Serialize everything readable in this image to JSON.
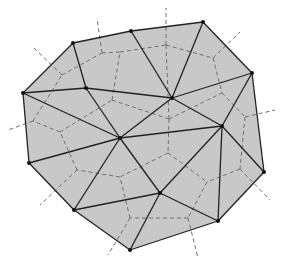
{
  "diagram": {
    "colors": {
      "fill": "#c8c8c8",
      "edge": "#222222",
      "dual": "#6f6f6f",
      "vertex": "#111111",
      "background": "#ffffff"
    },
    "hull": [
      [
        73,
        43
      ],
      [
        131,
        31
      ],
      [
        203,
        22
      ],
      [
        252,
        73
      ],
      [
        264,
        172
      ],
      [
        218,
        221
      ],
      [
        130,
        250
      ],
      [
        74,
        210
      ],
      [
        29,
        163
      ],
      [
        23,
        93
      ]
    ],
    "vertices": [
      [
        73,
        43
      ],
      [
        131,
        31
      ],
      [
        203,
        22
      ],
      [
        252,
        73
      ],
      [
        264,
        172
      ],
      [
        218,
        221
      ],
      [
        130,
        250
      ],
      [
        74,
        210
      ],
      [
        29,
        163
      ],
      [
        23,
        93
      ],
      [
        86,
        88
      ],
      [
        120,
        138
      ],
      [
        172,
        98
      ],
      [
        222,
        126
      ],
      [
        160,
        193
      ]
    ],
    "triangulation_edges": [
      [
        0,
        1
      ],
      [
        1,
        2
      ],
      [
        2,
        3
      ],
      [
        3,
        4
      ],
      [
        4,
        5
      ],
      [
        5,
        6
      ],
      [
        6,
        7
      ],
      [
        7,
        8
      ],
      [
        8,
        9
      ],
      [
        9,
        0
      ],
      [
        0,
        10
      ],
      [
        9,
        10
      ],
      [
        9,
        11
      ],
      [
        8,
        11
      ],
      [
        7,
        11
      ],
      [
        7,
        14
      ],
      [
        6,
        14
      ],
      [
        5,
        14
      ],
      [
        5,
        13
      ],
      [
        4,
        13
      ],
      [
        3,
        13
      ],
      [
        3,
        12
      ],
      [
        2,
        12
      ],
      [
        1,
        12
      ],
      [
        10,
        12
      ],
      [
        10,
        11
      ],
      [
        11,
        12
      ],
      [
        11,
        13
      ],
      [
        12,
        13
      ],
      [
        13,
        14
      ],
      [
        11,
        14
      ]
    ],
    "voronoi_edges": [
      [
        [
          62,
          75
        ],
        [
          34,
          48
        ]
      ],
      [
        [
          62,
          75
        ],
        [
          102,
          53
        ]
      ],
      [
        [
          102,
          53
        ],
        [
          97,
          18
        ]
      ],
      [
        [
          102,
          53
        ],
        [
          120,
          52
        ]
      ],
      [
        [
          120,
          52
        ],
        [
          166,
          45
        ]
      ],
      [
        [
          166,
          45
        ],
        [
          166,
          8
        ]
      ],
      [
        [
          166,
          45
        ],
        [
          213,
          58
        ]
      ],
      [
        [
          213,
          58
        ],
        [
          240,
          32
        ]
      ],
      [
        [
          213,
          58
        ],
        [
          222,
          93
        ]
      ],
      [
        [
          222,
          93
        ],
        [
          245,
          117
        ]
      ],
      [
        [
          245,
          117
        ],
        [
          275,
          110
        ]
      ],
      [
        [
          245,
          117
        ],
        [
          240,
          169
        ]
      ],
      [
        [
          240,
          169
        ],
        [
          270,
          200
        ]
      ],
      [
        [
          240,
          169
        ],
        [
          207,
          182
        ]
      ],
      [
        [
          207,
          182
        ],
        [
          188,
          218
        ]
      ],
      [
        [
          188,
          218
        ],
        [
          198,
          258
        ]
      ],
      [
        [
          188,
          218
        ],
        [
          130,
          218
        ]
      ],
      [
        [
          130,
          218
        ],
        [
          108,
          255
        ]
      ],
      [
        [
          130,
          218
        ],
        [
          120,
          177
        ]
      ],
      [
        [
          120,
          177
        ],
        [
          77,
          170
        ]
      ],
      [
        [
          77,
          170
        ],
        [
          40,
          205
        ]
      ],
      [
        [
          77,
          170
        ],
        [
          60,
          132
        ]
      ],
      [
        [
          60,
          132
        ],
        [
          33,
          121
        ]
      ],
      [
        [
          33,
          121
        ],
        [
          8,
          130
        ]
      ],
      [
        [
          33,
          121
        ],
        [
          62,
          75
        ]
      ],
      [
        [
          60,
          132
        ],
        [
          112,
          100
        ]
      ],
      [
        [
          112,
          100
        ],
        [
          120,
          52
        ]
      ],
      [
        [
          112,
          100
        ],
        [
          169,
          119
        ]
      ],
      [
        [
          169,
          119
        ],
        [
          166,
          45
        ]
      ],
      [
        [
          169,
          119
        ],
        [
          222,
          93
        ]
      ],
      [
        [
          169,
          119
        ],
        [
          168,
          153
        ]
      ],
      [
        [
          168,
          153
        ],
        [
          207,
          182
        ]
      ],
      [
        [
          168,
          153
        ],
        [
          120,
          177
        ]
      ]
    ]
  }
}
